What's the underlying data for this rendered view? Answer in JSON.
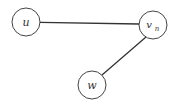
{
  "diagram": {
    "type": "graph",
    "nodes": [
      {
        "id": "u",
        "label": "u",
        "sub": "",
        "cx": 26,
        "cy": 22,
        "r": 14
      },
      {
        "id": "vn",
        "label": "v",
        "sub": "n",
        "cx": 153,
        "cy": 25,
        "r": 14
      },
      {
        "id": "w",
        "label": "w",
        "sub": "",
        "cx": 92,
        "cy": 85,
        "r": 14
      }
    ],
    "edges": [
      {
        "from": "u",
        "to": "vn"
      },
      {
        "from": "vn",
        "to": "w"
      }
    ],
    "colors": {
      "stroke": "#333333",
      "background": "#ffffff"
    }
  }
}
